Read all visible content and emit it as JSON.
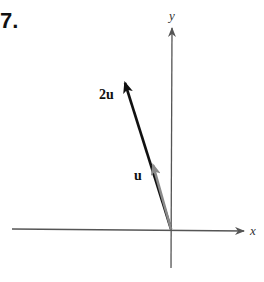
{
  "problem_number": "7.",
  "axes": {
    "x_label": "x",
    "y_label": "y"
  },
  "vectors": [
    {
      "label": "2u",
      "color": "#111111",
      "from": [
        171,
        229
      ],
      "to": [
        124,
        80
      ]
    },
    {
      "label": "u",
      "color": "#8a8a8a",
      "from": [
        171,
        229
      ],
      "to": [
        152,
        162
      ]
    }
  ],
  "colors": {
    "axis": "#555555",
    "vector_2u": "#111111",
    "vector_u": "#8a8a8a"
  }
}
